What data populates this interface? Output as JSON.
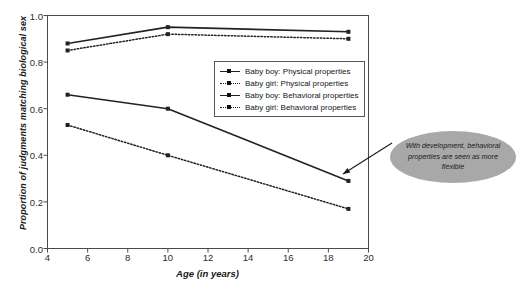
{
  "chart_data": {
    "type": "line",
    "title": "",
    "subtitle": "",
    "xlabel": "Age (in years)",
    "ylabel": "Proportion of judgments matching biological sex",
    "x": [
      5,
      10,
      19
    ],
    "xlim": [
      4,
      20
    ],
    "ylim": [
      0.0,
      1.0
    ],
    "xticks": [
      4,
      6,
      8,
      10,
      12,
      14,
      16,
      18,
      20
    ],
    "yticks": [
      "0.0",
      "0.2",
      "0.4",
      "0.6",
      "0.8",
      "1.0"
    ],
    "grid": false,
    "legend_position": "inside upper-center-right",
    "series": [
      {
        "name": "Baby boy: Physical properties",
        "style": "solid",
        "color": "#222222",
        "values": [
          0.88,
          0.95,
          0.93
        ]
      },
      {
        "name": "Baby girl: Physical properties",
        "style": "dotted",
        "color": "#222222",
        "values": [
          0.85,
          0.92,
          0.9
        ]
      },
      {
        "name": "Baby boy: Behavioral properties",
        "style": "solid",
        "color": "#222222",
        "values": [
          0.66,
          0.6,
          0.29
        ]
      },
      {
        "name": "Baby girl: Behavioral properties",
        "style": "dotted",
        "color": "#222222",
        "values": [
          0.53,
          0.4,
          0.17
        ]
      }
    ],
    "annotations": [
      {
        "text": "With development, behavioral properties are seen as more flexible",
        "shape": "ellipse",
        "fill": "#a8a8a8",
        "points_to": "Baby boy: Behavioral properties at age 19"
      }
    ]
  },
  "axis": {
    "yticks": [
      {
        "label": "1.0",
        "value": 1.0
      },
      {
        "label": "0.8",
        "value": 0.8
      },
      {
        "label": "0.6",
        "value": 0.6
      },
      {
        "label": "0.4",
        "value": 0.4
      },
      {
        "label": "0.2",
        "value": 0.2
      },
      {
        "label": "0.0",
        "value": 0.0
      }
    ],
    "xticks": [
      {
        "label": "4",
        "value": 4
      },
      {
        "label": "6",
        "value": 6
      },
      {
        "label": "8",
        "value": 8
      },
      {
        "label": "10",
        "value": 10
      },
      {
        "label": "12",
        "value": 12
      },
      {
        "label": "14",
        "value": 14
      },
      {
        "label": "16",
        "value": 16
      },
      {
        "label": "18",
        "value": 18
      },
      {
        "label": "20",
        "value": 20
      }
    ]
  },
  "legend": {
    "entries": [
      {
        "label": "Baby boy: Physical properties",
        "style": "solid"
      },
      {
        "label": "Baby girl: Physical properties",
        "style": "dotted"
      },
      {
        "label": "Baby boy: Behavioral properties",
        "style": "solid"
      },
      {
        "label": "Baby girl: Behavioral properties",
        "style": "dotted"
      }
    ]
  },
  "annotation": {
    "text": "With development, behavioral properties are seen as more flexible"
  }
}
